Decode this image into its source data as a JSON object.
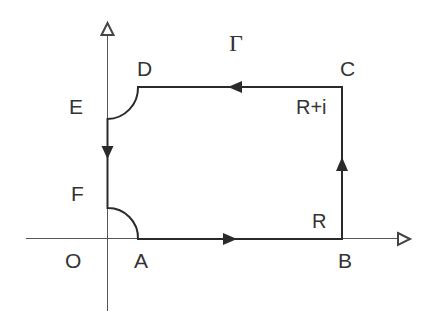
{
  "diagram": {
    "title_symbol": "Γ",
    "axes": {
      "origin_label": "O",
      "x_axis": "real axis (right-pointing open arrow)",
      "y_axis": "imaginary axis (up-pointing open arrow)"
    },
    "points": {
      "A": "A",
      "B": "B",
      "C": "C",
      "D": "D",
      "E": "E",
      "F": "F",
      "O": "O"
    },
    "annotations": {
      "B_value": "R",
      "C_value": "R+i"
    },
    "contour": {
      "segments": [
        {
          "from": "A",
          "to": "B",
          "kind": "line",
          "direction": "right"
        },
        {
          "from": "B",
          "to": "C",
          "kind": "line",
          "direction": "up"
        },
        {
          "from": "C",
          "to": "D",
          "kind": "line",
          "direction": "left"
        },
        {
          "from": "D",
          "to": "E",
          "kind": "quarter-arc"
        },
        {
          "from": "E",
          "to": "F",
          "kind": "line",
          "direction": "down"
        },
        {
          "from": "F",
          "to": "A",
          "kind": "quarter-arc"
        }
      ]
    },
    "colors": {
      "stroke": "#2a2a2a",
      "axis": "#555555",
      "background": "#ffffff"
    }
  }
}
